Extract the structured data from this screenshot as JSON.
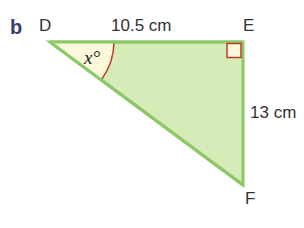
{
  "part_label": "b",
  "vertices": {
    "D": "D",
    "E": "E",
    "F": "F"
  },
  "sides": {
    "DE": "10.5 cm",
    "EF": "13 cm"
  },
  "angle_label": "x°",
  "colors": {
    "fill": "#d6ecb8",
    "stroke": "#8cc865",
    "angle_arc": "#c0392b",
    "angle_fill": "#fbf8dc",
    "right_angle": "#c0392b"
  }
}
